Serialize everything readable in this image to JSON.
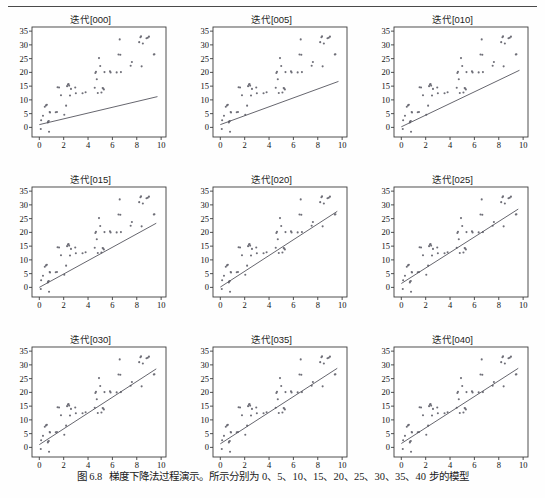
{
  "figure": {
    "caption_number": "图 6.8",
    "caption_text": "梯度下降法过程演示。所示分别为 0、5、10、15、20、25、30、35、40 步的模型"
  },
  "axes": {
    "y_ticks": [
      "0",
      "5",
      "10",
      "15",
      "20",
      "25",
      "30",
      "35"
    ],
    "y_values": [
      0,
      5,
      10,
      15,
      20,
      25,
      30,
      35
    ],
    "x_ticks": [
      "0",
      "2",
      "4",
      "6",
      "8",
      "10"
    ],
    "x_values": [
      0,
      2,
      4,
      6,
      8,
      10
    ],
    "xlim": [
      -0.6,
      10.4
    ],
    "ylim": [
      -3.5,
      36.5
    ],
    "dot_color": "#6f6f78",
    "line_color": "#55555e",
    "frame_color": "#3c3c3c"
  },
  "chart_data": {
    "type": "scatter",
    "title": "梯度下降法过程演示",
    "xlabel": "",
    "ylabel": "",
    "xlim": [
      -0.6,
      10.4
    ],
    "ylim": [
      -3.5,
      36.5
    ],
    "grid": false,
    "legend": null,
    "shared_scatter": {
      "name": "样本点",
      "x": [
        0.12,
        0.15,
        0.3,
        0.45,
        0.55,
        0.62,
        0.7,
        0.72,
        0.78,
        0.8,
        0.85,
        0.88,
        1.35,
        1.45,
        1.5,
        1.62,
        1.78,
        2.05,
        2.2,
        2.28,
        2.35,
        2.4,
        2.45,
        2.52,
        2.6,
        2.95,
        3.0,
        3.55,
        3.8,
        4.55,
        4.6,
        4.65,
        4.72,
        4.8,
        4.9,
        5.0,
        5.1,
        5.2,
        5.25,
        5.3,
        5.35,
        5.8,
        5.85,
        6.35,
        6.5,
        6.6,
        6.65,
        6.7,
        7.5,
        7.6,
        8.2,
        8.3,
        8.35,
        8.4,
        8.5,
        8.8,
        8.9,
        9.0,
        9.4,
        9.45
      ],
      "y": [
        -0.6,
        2.6,
        4.2,
        7.5,
        8.0,
        8.2,
        1.8,
        2.1,
        2.3,
        -1.6,
        5.6,
        5.4,
        5.5,
        5.6,
        14.6,
        14.5,
        11.7,
        4.6,
        7.9,
        15.0,
        15.6,
        15.8,
        15.2,
        11.6,
        14.0,
        14.5,
        12.4,
        12.4,
        12.8,
        14.4,
        19.8,
        20.2,
        17.5,
        12.5,
        25.2,
        22.3,
        12.7,
        14.3,
        14.1,
        13.8,
        20.1,
        20.4,
        20.0,
        20.0,
        26.5,
        32.0,
        26.4,
        20.1,
        22.4,
        23.8,
        31.0,
        32.8,
        33.1,
        22.2,
        30.5,
        32.4,
        32.6,
        33.0,
        26.5,
        26.6
      ]
    },
    "panels": [
      {
        "title": "迭代[000]",
        "step": 0,
        "line": {
          "intercept": 1.0,
          "slope": 1.05,
          "x_start": 0.0,
          "x_end": 9.7
        }
      },
      {
        "title": "迭代[005]",
        "step": 5,
        "line": {
          "intercept": 1.0,
          "slope": 1.62,
          "x_start": 0.0,
          "x_end": 9.7
        }
      },
      {
        "title": "迭代[010]",
        "step": 10,
        "line": {
          "intercept": 0.2,
          "slope": 2.12,
          "x_start": 0.0,
          "x_end": 9.7
        }
      },
      {
        "title": "迭代[015]",
        "step": 15,
        "line": {
          "intercept": 0.0,
          "slope": 2.43,
          "x_start": 0.0,
          "x_end": 9.6
        }
      },
      {
        "title": "迭代[020]",
        "step": 20,
        "line": {
          "intercept": 0.1,
          "slope": 2.87,
          "x_start": 0.0,
          "x_end": 9.6
        }
      },
      {
        "title": "迭代[025]",
        "step": 25,
        "line": {
          "intercept": 1.4,
          "slope": 2.82,
          "x_start": 0.0,
          "x_end": 9.6
        }
      },
      {
        "title": "迭代[030]",
        "step": 30,
        "line": {
          "intercept": 1.0,
          "slope": 2.87,
          "x_start": 0.0,
          "x_end": 9.6
        }
      },
      {
        "title": "迭代[035]",
        "step": 35,
        "line": {
          "intercept": 1.3,
          "slope": 2.86,
          "x_start": 0.0,
          "x_end": 9.6
        }
      },
      {
        "title": "迭代[040]",
        "step": 40,
        "line": {
          "intercept": 1.4,
          "slope": 2.85,
          "x_start": 0.0,
          "x_end": 9.6
        }
      }
    ]
  }
}
